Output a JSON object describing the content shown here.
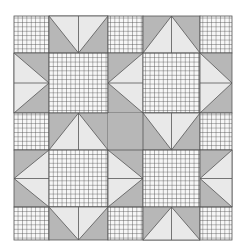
{
  "colors": {
    "background": "#ffffff",
    "dark": "#b7b7b7",
    "light": "#e9e9e9",
    "check_bg": "#f7f7f7",
    "check_line": "#4a4a4a",
    "seam": "#555555"
  },
  "grid": {
    "cols": [
      14,
      49,
      108,
      143,
      200,
      232
    ],
    "rows": [
      16,
      53,
      113,
      150,
      207,
      240
    ]
  },
  "cells": [
    {
      "r": 0,
      "c": 0,
      "type": "check"
    },
    {
      "r": 0,
      "c": 1,
      "type": "geese",
      "dir": "down"
    },
    {
      "r": 0,
      "c": 2,
      "type": "check"
    },
    {
      "r": 0,
      "c": 3,
      "type": "geese",
      "dir": "up"
    },
    {
      "r": 0,
      "c": 4,
      "type": "check"
    },
    {
      "r": 1,
      "c": 0,
      "type": "geese",
      "dir": "right"
    },
    {
      "r": 1,
      "c": 1,
      "type": "check"
    },
    {
      "r": 1,
      "c": 2,
      "type": "geese",
      "dir": "left"
    },
    {
      "r": 1,
      "c": 3,
      "type": "check"
    },
    {
      "r": 1,
      "c": 4,
      "type": "geese",
      "dir": "right"
    },
    {
      "r": 2,
      "c": 0,
      "type": "check"
    },
    {
      "r": 2,
      "c": 1,
      "type": "geese",
      "dir": "up"
    },
    {
      "r": 2,
      "c": 2,
      "type": "solid"
    },
    {
      "r": 2,
      "c": 3,
      "type": "geese",
      "dir": "down"
    },
    {
      "r": 2,
      "c": 4,
      "type": "check"
    },
    {
      "r": 3,
      "c": 0,
      "type": "geese",
      "dir": "left"
    },
    {
      "r": 3,
      "c": 1,
      "type": "check"
    },
    {
      "r": 3,
      "c": 2,
      "type": "geese",
      "dir": "right"
    },
    {
      "r": 3,
      "c": 3,
      "type": "check"
    },
    {
      "r": 3,
      "c": 4,
      "type": "geese",
      "dir": "left"
    },
    {
      "r": 4,
      "c": 0,
      "type": "check"
    },
    {
      "r": 4,
      "c": 1,
      "type": "geese",
      "dir": "down"
    },
    {
      "r": 4,
      "c": 2,
      "type": "check"
    },
    {
      "r": 4,
      "c": 3,
      "type": "geese",
      "dir": "up"
    },
    {
      "r": 4,
      "c": 4,
      "type": "check"
    }
  ]
}
